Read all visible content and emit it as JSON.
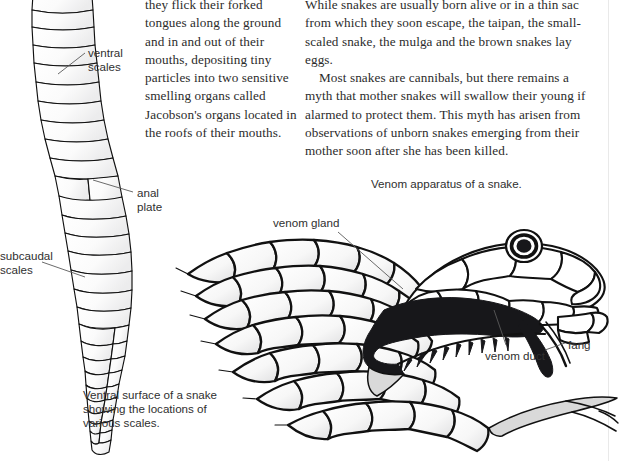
{
  "document": {
    "columns": {
      "left": [
        "they flick their forked tongues along the ground and in and out of their mouths, depositing tiny particles into two sensitive smelling organs called Jacobson's organs located in the roofs of their mouths."
      ],
      "right": [
        "While snakes are usually born alive or in a thin sac from which they soon escape, the taipan, the small-scaled snake, the mulga and the brown snakes lay eggs.",
        "Most snakes are cannibals, but there remains a myth that mother snakes will swallow their young if alarmed to protect them. This myth has arisen from observations of unborn snakes emerging from their mother soon after she has been killed."
      ]
    },
    "figures": {
      "ventral_snake": {
        "caption": "Ventral surface of a snake\nshowing the locations of\nvarious scales.",
        "labels": {
          "ventral_scales": "ventral\nscales",
          "anal_plate": "anal\nplate",
          "subcaudal_scales": "subcaudal\nscales"
        }
      },
      "venom_apparatus": {
        "caption": "Venom apparatus of a snake.",
        "labels": {
          "venom_gland": "venom gland",
          "venom_duct": "venom duct",
          "fang": "fang"
        }
      }
    },
    "colors": {
      "ink": "#2b2b2b",
      "label_ink": "#2f2f2f",
      "line_art": "#111111",
      "gland_fill": "#17171a",
      "leader_line": "#5a5a5a",
      "page_background": "#ffffff"
    }
  }
}
